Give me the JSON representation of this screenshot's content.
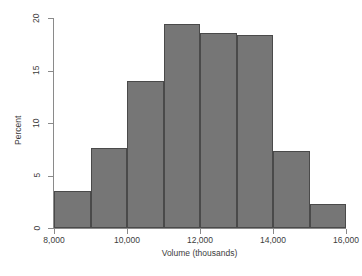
{
  "chart_data": {
    "type": "bar",
    "title": "",
    "subtitle": "",
    "xlabel": "Volume (thousands)",
    "ylabel": "Percent",
    "xlim": [
      8000,
      16000
    ],
    "ylim": [
      0,
      20
    ],
    "grid": false,
    "legend": null,
    "bin_width": 1000,
    "categories": [
      "8,000-9,000",
      "9,000-10,000",
      "10,000-11,000",
      "11,000-12,000",
      "12,000-13,000",
      "13,000-14,000",
      "14,000-15,000",
      "15,000-16,000"
    ],
    "bin_edges": [
      8000,
      9000,
      10000,
      11000,
      12000,
      13000,
      14000,
      15000,
      16000
    ],
    "values": [
      3.5,
      7.6,
      14.0,
      19.4,
      18.6,
      18.4,
      7.3,
      2.3
    ],
    "x_ticks": [
      8000,
      10000,
      12000,
      14000,
      16000
    ],
    "x_tick_labels": [
      "8,000",
      "10,000",
      "12,000",
      "14,000",
      "16,000"
    ],
    "y_ticks": [
      0,
      5,
      10,
      15,
      20
    ],
    "y_tick_labels": [
      "0",
      "5",
      "10",
      "15",
      "20"
    ],
    "bar_color": "#767676",
    "bar_edge_color": "#4a4a4a",
    "axis_color": "#8a8a8a",
    "background_color": "#ffffff"
  }
}
